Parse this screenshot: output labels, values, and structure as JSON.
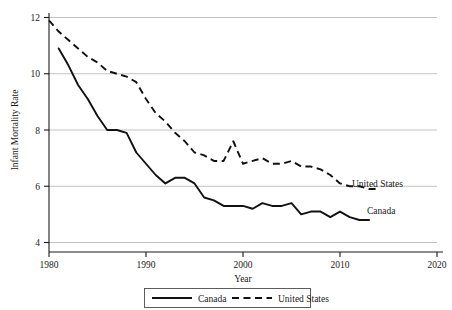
{
  "chart_data": {
    "type": "line",
    "title": "",
    "xlabel": "Year",
    "ylabel": "Infant Mortality Rate",
    "xlim": [
      1980,
      2020
    ],
    "ylim": [
      4,
      12
    ],
    "xticks": [
      "1980",
      "1990",
      "2000",
      "2010",
      "2020"
    ],
    "yticks": [
      "4",
      "6",
      "8",
      "10",
      "12"
    ],
    "grid": "horizontal",
    "legend_position": "below-axis",
    "series": [
      {
        "name": "Canada",
        "style": "solid",
        "inline_label": "Canada",
        "x": [
          1981,
          1982,
          1983,
          1984,
          1985,
          1986,
          1987,
          1988,
          1989,
          1990,
          1991,
          1992,
          1993,
          1994,
          1995,
          1996,
          1997,
          1998,
          1999,
          2000,
          2001,
          2002,
          2003,
          2004,
          2005,
          2006,
          2007,
          2008,
          2009,
          2010,
          2011,
          2012,
          2013
        ],
        "values": [
          10.9,
          10.3,
          9.6,
          9.1,
          8.5,
          8.0,
          8.0,
          7.9,
          7.2,
          6.8,
          6.4,
          6.1,
          6.3,
          6.3,
          6.1,
          5.6,
          5.5,
          5.3,
          5.3,
          5.3,
          5.2,
          5.4,
          5.3,
          5.3,
          5.4,
          5.0,
          5.1,
          5.1,
          4.9,
          5.1,
          4.9,
          4.8,
          4.8
        ]
      },
      {
        "name": "United States",
        "style": "dashed",
        "inline_label": "United States",
        "x": [
          1980,
          1981,
          1982,
          1983,
          1984,
          1985,
          1986,
          1987,
          1988,
          1989,
          1990,
          1991,
          1992,
          1993,
          1994,
          1995,
          1996,
          1997,
          1998,
          1999,
          2000,
          2001,
          2002,
          2003,
          2004,
          2005,
          2006,
          2007,
          2008,
          2009,
          2010,
          2011,
          2012,
          2013,
          2014
        ],
        "values": [
          11.9,
          11.5,
          11.2,
          10.9,
          10.6,
          10.4,
          10.1,
          10.0,
          9.9,
          9.7,
          9.1,
          8.6,
          8.3,
          7.9,
          7.6,
          7.2,
          7.1,
          6.9,
          6.9,
          7.6,
          6.8,
          6.9,
          7.0,
          6.8,
          6.8,
          6.9,
          6.7,
          6.7,
          6.6,
          6.4,
          6.1,
          6.0,
          6.0,
          5.9,
          5.9
        ]
      }
    ]
  },
  "legend": {
    "items": [
      {
        "label": "Canada",
        "style": "solid"
      },
      {
        "label": "United States",
        "style": "dashed"
      }
    ]
  }
}
